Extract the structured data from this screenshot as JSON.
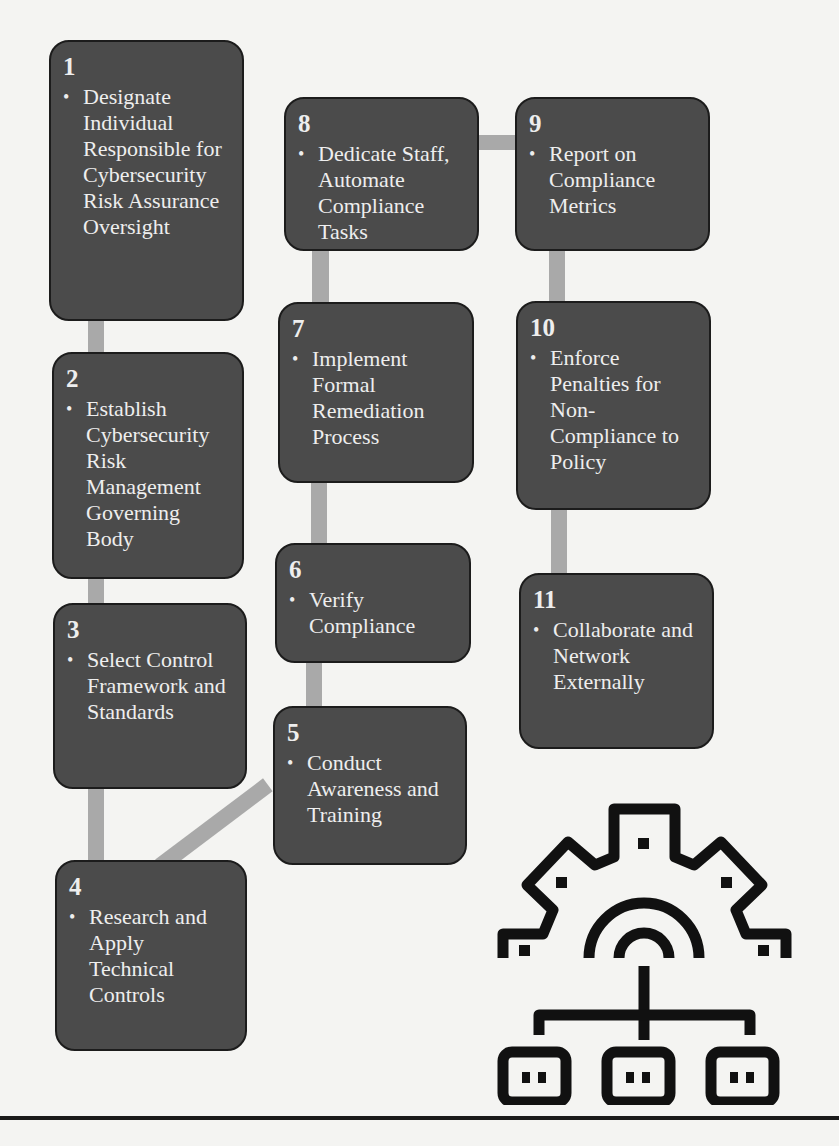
{
  "diagram": {
    "steps": [
      {
        "number": "1",
        "text": "Designate Individual Responsible for Cybersecurity Risk Assurance Oversight"
      },
      {
        "number": "2",
        "text": "Establish Cybersecurity Risk Management Governing Body"
      },
      {
        "number": "3",
        "text": "Select Control Framework and Standards"
      },
      {
        "number": "4",
        "text": "Research and Apply Technical Controls"
      },
      {
        "number": "5",
        "text": "Conduct Awareness and Training"
      },
      {
        "number": "6",
        "text": "Verify Compliance"
      },
      {
        "number": "7",
        "text": "Implement Formal Remediation Process"
      },
      {
        "number": "8",
        "text": "Dedicate Staff, Automate Compliance Tasks"
      },
      {
        "number": "9",
        "text": "Report on Compliance Metrics"
      },
      {
        "number": "10",
        "text": "Enforce Penalties for Non-Compliance to Policy"
      },
      {
        "number": "11",
        "text": "Collaborate and Network Externally"
      }
    ],
    "bullet": "•",
    "icon": "gear-network-icon",
    "colors": {
      "box_fill": "#4b4b4b",
      "box_border": "#1c1c1c",
      "text": "#eeeeee",
      "connector": "#a9a9a9",
      "icon": "#111111"
    }
  }
}
